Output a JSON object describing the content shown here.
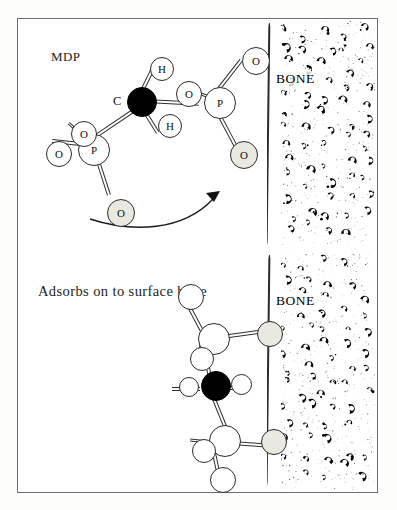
{
  "figure": {
    "title_visible": false,
    "panels": [
      {
        "id": "top",
        "caption": "MDP",
        "bone_label": "BONE",
        "molecule_name": "MDP",
        "atoms": [
          {
            "label": "C",
            "kind": "carbon"
          },
          {
            "label": "H",
            "kind": "hydrogen"
          },
          {
            "label": "H",
            "kind": "hydrogen"
          },
          {
            "label": "P",
            "kind": "phosphorus"
          },
          {
            "label": "P",
            "kind": "phosphorus"
          },
          {
            "label": "O",
            "kind": "oxygen"
          },
          {
            "label": "O",
            "kind": "oxygen"
          },
          {
            "label": "O",
            "kind": "oxygen"
          },
          {
            "label": "O",
            "kind": "oxygen"
          },
          {
            "label": "O",
            "kind": "oxygen"
          },
          {
            "label": "O",
            "kind": "oxygen"
          }
        ],
        "arrow": {
          "present": true,
          "direction": "left-to-right-curved",
          "points_to": "bone surface"
        }
      },
      {
        "id": "bottom",
        "caption": "Adsorbs on to surface bone",
        "bone_label": "BONE",
        "molecule_name": "MDP adsorbed",
        "atoms": [
          {
            "label": "",
            "kind": "carbon"
          },
          {
            "label": "",
            "kind": "hydrogen"
          },
          {
            "label": "",
            "kind": "hydrogen"
          },
          {
            "label": "",
            "kind": "phosphorus"
          },
          {
            "label": "",
            "kind": "phosphorus"
          },
          {
            "label": "",
            "kind": "oxygen"
          },
          {
            "label": "",
            "kind": "oxygen"
          },
          {
            "label": "",
            "kind": "oxygen"
          },
          {
            "label": "",
            "kind": "oxygen"
          },
          {
            "label": "",
            "kind": "oxygen"
          },
          {
            "label": "",
            "kind": "oxygen"
          }
        ],
        "arrow": {
          "present": false
        }
      }
    ]
  },
  "colors": {
    "frame": "#6e6e6e",
    "ink": "#111111",
    "carbon_fill": "#000000",
    "atom_fill": "#ffffff",
    "atom_shaded_fill": "#e9e9e2",
    "bone_speck": "#000000",
    "background": "#ffffff"
  },
  "labels": {
    "mdp": "MDP",
    "adsorbs": "Adsorbs on to surface bone",
    "bone_top": "BONE",
    "bone_bottom": "BONE",
    "atom_c": "C",
    "atom_h_upper": "H",
    "atom_h_lower": "H",
    "atom_p_left": "P",
    "atom_p_right": "P",
    "atom_o_1": "O",
    "atom_o_2": "O",
    "atom_o_3": "O",
    "atom_o_4": "O",
    "atom_o_5": "O",
    "atom_o_6": "O"
  }
}
